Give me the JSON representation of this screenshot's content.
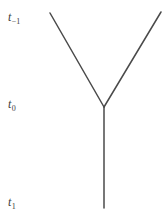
{
  "figure": {
    "name": "binary-branching-time-diagram",
    "background_color": "#ffffff",
    "width": 165,
    "height": 224,
    "stroke_color": "#4a4a4a",
    "stroke_width": 1.5,
    "text_color": "#3d3d3d"
  },
  "labels": [
    {
      "id": "t-minus-1",
      "base": "t",
      "subscript": "−1",
      "text": "t₋₁",
      "x": 8,
      "y": 11
    },
    {
      "id": "t-zero",
      "base": "t",
      "subscript": "0",
      "text": "t₀",
      "x": 8,
      "y": 98
    },
    {
      "id": "t-one",
      "base": "t",
      "subscript": "1",
      "text": "t₁",
      "x": 8,
      "y": 196
    }
  ],
  "diagram": {
    "vertex": {
      "x": 104,
      "y": 107
    },
    "segments": [
      {
        "id": "left-branch",
        "name": "left-upper-branch",
        "x1": 50,
        "y1": 13,
        "x2": 104,
        "y2": 107
      },
      {
        "id": "right-branch",
        "name": "right-upper-branch",
        "x1": 161,
        "y1": 12,
        "x2": 104,
        "y2": 107
      },
      {
        "id": "stem",
        "name": "lower-trunk",
        "x1": 104,
        "y1": 107,
        "x2": 104,
        "y2": 208
      }
    ]
  },
  "chart_data": {
    "type": "diagram",
    "title": "",
    "nodes": [
      {
        "id": "vertex",
        "label": "",
        "x": 104,
        "y": 107,
        "time": "t_0"
      },
      {
        "id": "left-tip",
        "label": "",
        "x": 50,
        "y": 13,
        "time": "t_-1"
      },
      {
        "id": "right-tip",
        "label": "",
        "x": 161,
        "y": 12,
        "time": "t_-1"
      },
      {
        "id": "trunk-end",
        "label": "",
        "x": 104,
        "y": 208,
        "time": "t_1"
      }
    ],
    "edges": [
      {
        "from": "left-tip",
        "to": "vertex"
      },
      {
        "from": "right-tip",
        "to": "vertex"
      },
      {
        "from": "vertex",
        "to": "trunk-end"
      }
    ],
    "time_axis": {
      "orientation": "vertical",
      "direction": "downward",
      "tick_labels": [
        "t₋₁",
        "t₀",
        "t₁"
      ],
      "tick_positions_px": [
        17,
        104,
        202
      ]
    },
    "grid": false,
    "legend": null
  }
}
